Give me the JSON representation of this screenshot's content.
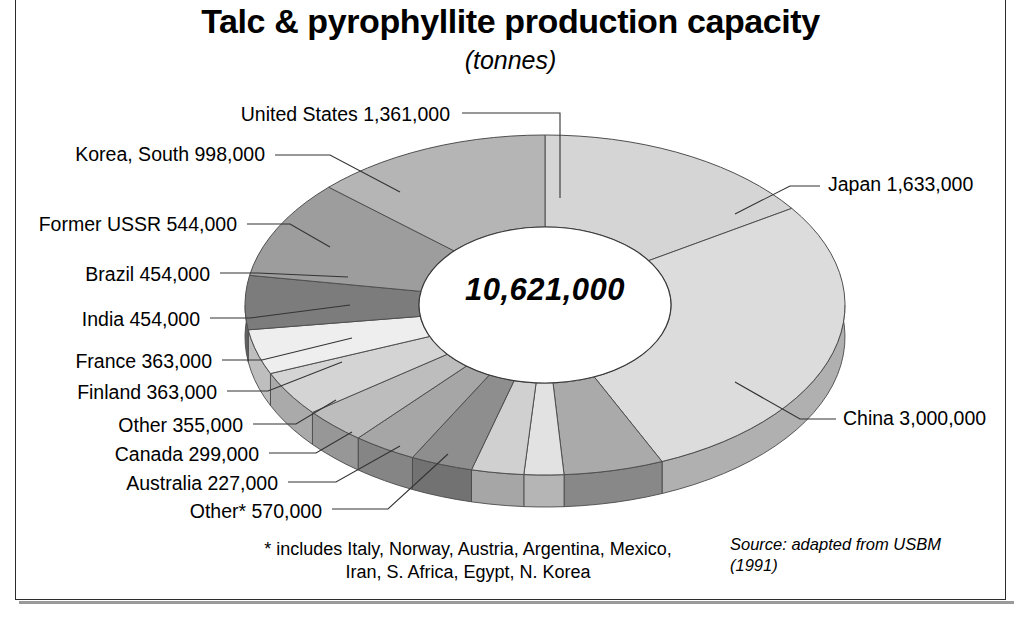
{
  "figure": {
    "title": "Talc & pyrophyllite production capacity",
    "subtitle": "(tonnes)",
    "center_total": "10,621,000",
    "footnote": "* includes Italy, Norway, Austria, Argentina, Mexico, Iran, S. Africa, Egypt, N. Korea",
    "source": "Source: adapted from USBM (1991)"
  },
  "labels": {
    "united_states": "United States 1,361,000",
    "korea_south": "Korea, South 998,000",
    "former_ussr": "Former USSR 544,000",
    "brazil": "Brazil 454,000",
    "india": "India 454,000",
    "france": "France 363,000",
    "finland": "Finland 363,000",
    "other": "Other 355,000",
    "canada": "Canada 299,000",
    "australia": "Australia 227,000",
    "other_star": "Other*  570,000",
    "japan": "Japan 1,633,000",
    "china": "China 3,000,000"
  },
  "chart_data": {
    "type": "pie",
    "title": "Talc & pyrophyllite production capacity",
    "subtitle": "(tonnes)",
    "unit": "tonnes",
    "total": 10621000,
    "total_label": "10,621,000",
    "style": "3d-doughnut",
    "start_angle_deg": 0,
    "direction": "clockwise",
    "categories": [
      "Japan",
      "China",
      "Other*",
      "Australia",
      "Canada",
      "Other",
      "Finland",
      "France",
      "India",
      "Brazil",
      "Former USSR",
      "Korea, South",
      "United States"
    ],
    "values": [
      1633000,
      3000000,
      570000,
      227000,
      299000,
      355000,
      363000,
      363000,
      454000,
      454000,
      544000,
      998000,
      1361000
    ],
    "value_labels": [
      "1,633,000",
      "3,000,000",
      "570,000",
      "227,000",
      "299,000",
      "355,000",
      "363,000",
      "363,000",
      "454,000",
      "454,000",
      "544,000",
      "998,000",
      "1,361,000"
    ],
    "slice_colors": [
      "#d5d5d5",
      "#dcdcdc",
      "#aaaaaa",
      "#e2e2e2",
      "#d0d0d0",
      "#8e8e8e",
      "#a6a6a6",
      "#bdbdbd",
      "#d4d4d4",
      "#eeeeee",
      "#7c7c7c",
      "#9d9d9d",
      "#b5b5b5"
    ],
    "legend": "none",
    "grid": false,
    "footnote": "* includes Italy, Norway, Austria, Argentina, Mexico, Iran, S. Africa, Egypt, N. Korea",
    "source": "Source: adapted from USBM (1991)"
  }
}
